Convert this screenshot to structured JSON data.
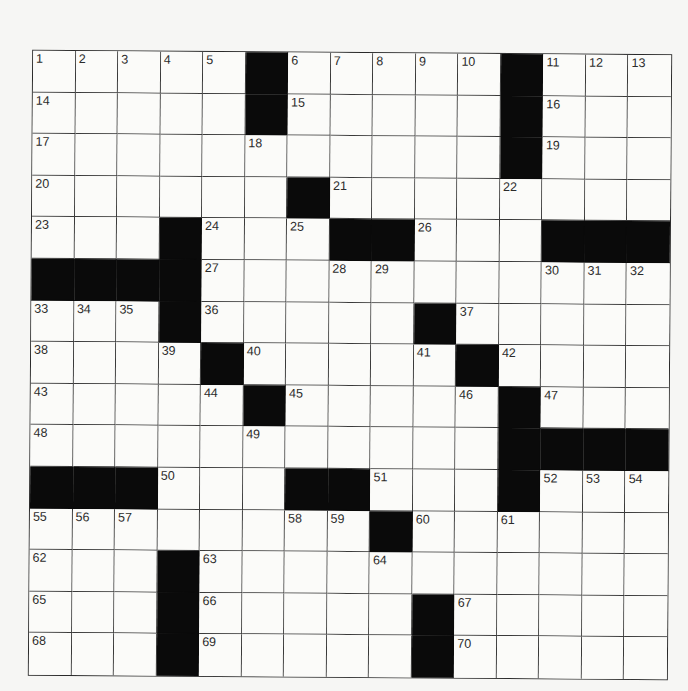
{
  "puzzle": {
    "rows": 15,
    "cols": 15,
    "colors": {
      "block": "#0a0a0a",
      "cell": "#fbfbf9",
      "line": "#3a3a3a",
      "number": "#2b2b2b",
      "page": "#f6f6f4"
    },
    "grid": [
      [
        "1",
        "2",
        "3",
        "4",
        "5",
        "#",
        "6",
        "7",
        "8",
        "9",
        "10",
        "#",
        "11",
        "12",
        "13"
      ],
      [
        "14",
        ".",
        ".",
        ".",
        ".",
        "#",
        "15",
        ".",
        ".",
        ".",
        ".",
        "#",
        "16",
        ".",
        "."
      ],
      [
        "17",
        ".",
        ".",
        ".",
        ".",
        "18",
        ".",
        ".",
        ".",
        ".",
        ".",
        "#",
        "19",
        ".",
        "."
      ],
      [
        "20",
        ".",
        ".",
        ".",
        ".",
        ".",
        "#",
        "21",
        ".",
        ".",
        ".",
        "22",
        ".",
        ".",
        "."
      ],
      [
        "23",
        ".",
        ".",
        "#",
        "24",
        ".",
        "25",
        "#",
        "#",
        "26",
        ".",
        ".",
        "#",
        "#",
        "#"
      ],
      [
        "#",
        "#",
        "#",
        "#",
        "27",
        ".",
        ".",
        "28",
        "29",
        ".",
        ".",
        ".",
        "30",
        "31",
        "32"
      ],
      [
        "33",
        "34",
        "35",
        "#",
        "36",
        ".",
        ".",
        ".",
        ".",
        "#",
        "37",
        ".",
        ".",
        ".",
        "."
      ],
      [
        "38",
        ".",
        ".",
        "39",
        "#",
        "40",
        ".",
        ".",
        ".",
        "41",
        "#",
        "42",
        ".",
        ".",
        "."
      ],
      [
        "43",
        ".",
        ".",
        ".",
        "44",
        "#",
        "45",
        ".",
        ".",
        ".",
        "46",
        "#",
        "47",
        ".",
        "."
      ],
      [
        "48",
        ".",
        ".",
        ".",
        ".",
        "49",
        ".",
        ".",
        ".",
        ".",
        ".",
        "#",
        "#",
        "#",
        "#"
      ],
      [
        "#",
        "#",
        "#",
        "50",
        ".",
        ".",
        "#",
        "#",
        "51",
        ".",
        ".",
        "#",
        "52",
        "53",
        "54"
      ],
      [
        "55",
        "56",
        "57",
        ".",
        ".",
        ".",
        "58",
        "59",
        "#",
        "60",
        ".",
        "61",
        ".",
        ".",
        "."
      ],
      [
        "62",
        ".",
        ".",
        "#",
        "63",
        ".",
        ".",
        ".",
        "64",
        ".",
        ".",
        ".",
        ".",
        ".",
        "."
      ],
      [
        "65",
        ".",
        ".",
        "#",
        "66",
        ".",
        ".",
        ".",
        ".",
        "#",
        "67",
        ".",
        ".",
        ".",
        "."
      ],
      [
        "68",
        ".",
        ".",
        "#",
        "69",
        ".",
        ".",
        ".",
        ".",
        "#",
        "70",
        ".",
        ".",
        ".",
        "."
      ]
    ]
  }
}
